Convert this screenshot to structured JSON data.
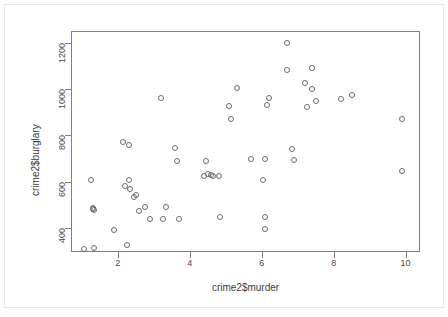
{
  "chart_data": {
    "type": "scatter",
    "title": "",
    "xlabel": "crime2$murder",
    "ylabel": "crime2$burglary",
    "xlim": [
      0.7,
      10.4
    ],
    "ylim": [
      296,
      1250
    ],
    "xticks": [
      2,
      4,
      6,
      8,
      10
    ],
    "yticks": [
      400,
      600,
      800,
      1000,
      1200
    ],
    "grid": false,
    "legend": null,
    "marker": "open-circle",
    "marker_color": "#6b6b6b",
    "x": [
      1.05,
      1.35,
      1.25,
      1.3,
      1.35,
      1.3,
      1.9,
      2.15,
      2.2,
      2.3,
      2.3,
      2.25,
      2.35,
      2.45,
      2.5,
      2.6,
      2.75,
      2.9,
      3.2,
      3.25,
      3.35,
      3.6,
      3.65,
      3.7,
      4.4,
      4.45,
      4.5,
      4.6,
      4.65,
      4.8,
      4.85,
      5.1,
      5.15,
      5.3,
      5.7,
      6.05,
      6.1,
      6.1,
      6.1,
      6.15,
      6.2,
      6.7,
      6.7,
      6.85,
      6.9,
      7.2,
      7.25,
      7.4,
      7.4,
      7.5,
      8.2,
      8.5,
      9.9,
      9.9
    ],
    "y": [
      310,
      312,
      607,
      487,
      478,
      480,
      389,
      770,
      580,
      607,
      760,
      325,
      566,
      533,
      540,
      474,
      492,
      437,
      960,
      440,
      492,
      745,
      690,
      440,
      622,
      690,
      632,
      628,
      622,
      622,
      445,
      928,
      872,
      1005,
      697,
      607,
      395,
      448,
      697,
      932,
      962,
      1200,
      1082,
      740,
      694,
      1025,
      920,
      1092,
      1000,
      950,
      955,
      975,
      872,
      644
    ],
    "n_points": 54
  },
  "axis": {
    "y_tick_labels": [
      "400",
      "600",
      "800",
      "1000",
      "1200"
    ],
    "x_tick_labels": [
      "2",
      "4",
      "6",
      "8",
      "10"
    ]
  }
}
